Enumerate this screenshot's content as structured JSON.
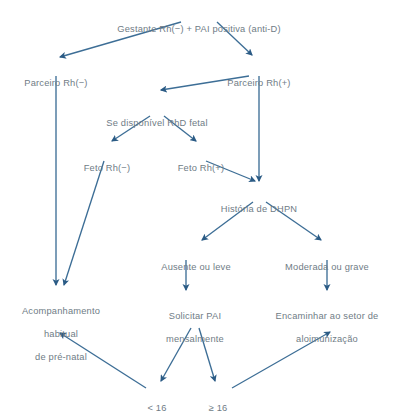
{
  "diagram": {
    "type": "flowchart",
    "text_color": "#6f7c86",
    "edge_color": "#3d6e96",
    "background_color": "#ffffff",
    "nodes": [
      {
        "id": "gestante",
        "label": "Gestante Rh(−) + PAI positiva (anti-D)",
        "lines": [
          "Gestante Rh(−) + PAI positiva (anti-D)"
        ],
        "x": 199,
        "y": 12
      },
      {
        "id": "parceiro_neg",
        "label": "Parceiro Rh(−)",
        "lines": [
          "Parceiro Rh(−)"
        ],
        "x": 56,
        "y": 66
      },
      {
        "id": "parceiro_pos",
        "label": "Parceiro Rh(+)",
        "lines": [
          "Parceiro Rh(+)"
        ],
        "x": 259,
        "y": 66
      },
      {
        "id": "rhd_fetal",
        "label": "Se disponível RhD fetal",
        "lines": [
          "Se disponível RhD fetal"
        ],
        "x": 157,
        "y": 106
      },
      {
        "id": "feto_neg",
        "label": "Feto Rh(−)",
        "lines": [
          "Feto Rh(−)"
        ],
        "x": 107,
        "y": 151
      },
      {
        "id": "feto_pos",
        "label": "Feto Rh(+)",
        "lines": [
          "Feto Rh(+)"
        ],
        "x": 201,
        "y": 151
      },
      {
        "id": "historia_dhpn",
        "label": "História de DHPN",
        "lines": [
          "História de DHPN"
        ],
        "x": 259,
        "y": 192
      },
      {
        "id": "ausente_leve",
        "label": "Ausente ou leve",
        "lines": [
          "Ausente ou leve"
        ],
        "x": 196,
        "y": 250
      },
      {
        "id": "moderada_grave",
        "label": "Moderada ou grave",
        "lines": [
          "Moderada ou grave"
        ],
        "x": 327,
        "y": 250
      },
      {
        "id": "acompanhamento",
        "label": "Acompanhamento habitual de pré-natal",
        "lines": [
          "Acompanhamento",
          "habitual",
          "de pré-natal"
        ],
        "x": 61,
        "y": 294
      },
      {
        "id": "solicitar_pai",
        "label": "Solicitar PAI mensalmente",
        "lines": [
          "Solicitar PAI",
          "mensalmente"
        ],
        "x": 195,
        "y": 299
      },
      {
        "id": "encaminhar",
        "label": "Encaminhar ao setor de aloimunização",
        "lines": [
          "Encaminhar ao setor de",
          "aloimunização"
        ],
        "x": 327,
        "y": 299
      },
      {
        "id": "menor16",
        "label": "< 16",
        "lines": [
          "< 16"
        ],
        "x": 157,
        "y": 391
      },
      {
        "id": "maior16",
        "label": "≥ 16",
        "lines": [
          "≥ 16"
        ],
        "x": 218,
        "y": 391
      }
    ],
    "edges": [
      {
        "id": "gestante-to-parceiro-neg",
        "from": "gestante",
        "to": "parceiro_neg"
      },
      {
        "id": "gestante-to-parceiro-pos",
        "from": "gestante",
        "to": "parceiro_pos"
      },
      {
        "id": "parceiro-pos-to-rhd-fetal",
        "from": "parceiro_pos",
        "to": "rhd_fetal"
      },
      {
        "id": "parceiro-pos-to-historia",
        "from": "parceiro_pos",
        "to": "historia_dhpn"
      },
      {
        "id": "rhd-fetal-to-feto-neg",
        "from": "rhd_fetal",
        "to": "feto_neg"
      },
      {
        "id": "rhd-fetal-to-feto-pos",
        "from": "rhd_fetal",
        "to": "feto_pos"
      },
      {
        "id": "feto-pos-to-historia",
        "from": "feto_pos",
        "to": "historia_dhpn"
      },
      {
        "id": "parceiro-neg-to-acompanhamento",
        "from": "parceiro_neg",
        "to": "acompanhamento"
      },
      {
        "id": "feto-neg-to-acompanhamento",
        "from": "feto_neg",
        "to": "acompanhamento"
      },
      {
        "id": "historia-to-ausente-leve",
        "from": "historia_dhpn",
        "to": "ausente_leve"
      },
      {
        "id": "historia-to-moderada-grave",
        "from": "historia_dhpn",
        "to": "moderada_grave"
      },
      {
        "id": "ausente-to-solicitar-pai",
        "from": "ausente_leve",
        "to": "solicitar_pai"
      },
      {
        "id": "moderada-to-encaminhar",
        "from": "moderada_grave",
        "to": "encaminhar"
      },
      {
        "id": "solicitar-to-menor16",
        "from": "solicitar_pai",
        "to": "menor16"
      },
      {
        "id": "solicitar-to-maior16",
        "from": "solicitar_pai",
        "to": "maior16"
      },
      {
        "id": "menor16-to-acompanhamento",
        "from": "menor16",
        "to": "acompanhamento"
      },
      {
        "id": "maior16-to-encaminhar",
        "from": "maior16",
        "to": "encaminhar"
      }
    ]
  }
}
